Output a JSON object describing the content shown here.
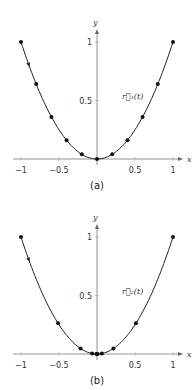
{
  "chart_data": [
    {
      "type": "line",
      "caption": "(a)",
      "curve_label": "r⃗₁(t)",
      "xlabel": "x",
      "ylabel": "y",
      "xlim": [
        -1,
        1
      ],
      "ylim": [
        0,
        1
      ],
      "xticks": [
        "-1",
        "-0.5",
        "0.5",
        "1"
      ],
      "yticks": [
        "0.5",
        "1"
      ],
      "curve": "y = x^2",
      "points": [
        [
          -1,
          1
        ],
        [
          -0.8,
          0.64
        ],
        [
          -0.6,
          0.36
        ],
        [
          -0.4,
          0.16
        ],
        [
          -0.2,
          0.04
        ],
        [
          0,
          0
        ],
        [
          0.2,
          0.04
        ],
        [
          0.4,
          0.16
        ],
        [
          0.6,
          0.36
        ],
        [
          0.8,
          0.64
        ],
        [
          1,
          1
        ]
      ],
      "arrow_direction": "downward along left branch"
    },
    {
      "type": "line",
      "caption": "(b)",
      "curve_label": "r⃗₂(t)",
      "xlabel": "x",
      "ylabel": "y",
      "xlim": [
        -1,
        1
      ],
      "ylim": [
        0,
        1
      ],
      "xticks": [
        "-1",
        "-0.5",
        "0.5",
        "1"
      ],
      "yticks": [
        "0.5",
        "1"
      ],
      "curve": "y = x^2",
      "points": [
        [
          -1,
          1
        ],
        [
          -0.512,
          0.262
        ],
        [
          -0.216,
          0.047
        ],
        [
          -0.064,
          0.004
        ],
        [
          -0.008,
          0
        ],
        [
          0,
          0
        ],
        [
          0.008,
          0
        ],
        [
          0.064,
          0.004
        ],
        [
          0.216,
          0.047
        ],
        [
          0.512,
          0.262
        ],
        [
          1,
          1
        ]
      ],
      "arrow_direction": "downward along left branch"
    }
  ]
}
